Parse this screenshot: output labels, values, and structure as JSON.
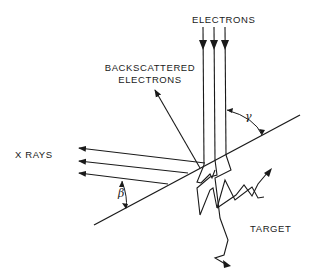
{
  "diagram": {
    "type": "physics-schematic",
    "labels": {
      "electrons": "ELECTRONS",
      "backscattered_line1": "BACKSCATTERED",
      "backscattered_line2": "ELECTRONS",
      "xrays": "X  RAYS",
      "target": "TARGET",
      "gamma": "γ",
      "beta": "β"
    },
    "elements": [
      {
        "id": "incident-electrons",
        "kind": "arrow-group",
        "count": 3,
        "direction": "down"
      },
      {
        "id": "target-surface",
        "kind": "line",
        "orientation": "diagonal"
      },
      {
        "id": "backscattered-electron",
        "kind": "arrow",
        "direction": "up-left"
      },
      {
        "id": "xray-beams",
        "kind": "arrow-group",
        "count": 3,
        "direction": "left"
      },
      {
        "id": "angle-gamma",
        "kind": "angle-arc",
        "between": [
          "incident beam",
          "target surface"
        ]
      },
      {
        "id": "angle-beta",
        "kind": "angle-arc",
        "between": [
          "x-ray beam",
          "target surface"
        ]
      },
      {
        "id": "scattering-paths",
        "kind": "zigzag-paths",
        "count": 3
      }
    ],
    "colors": {
      "ink": "#1a1a1a",
      "background": "#ffffff"
    }
  }
}
